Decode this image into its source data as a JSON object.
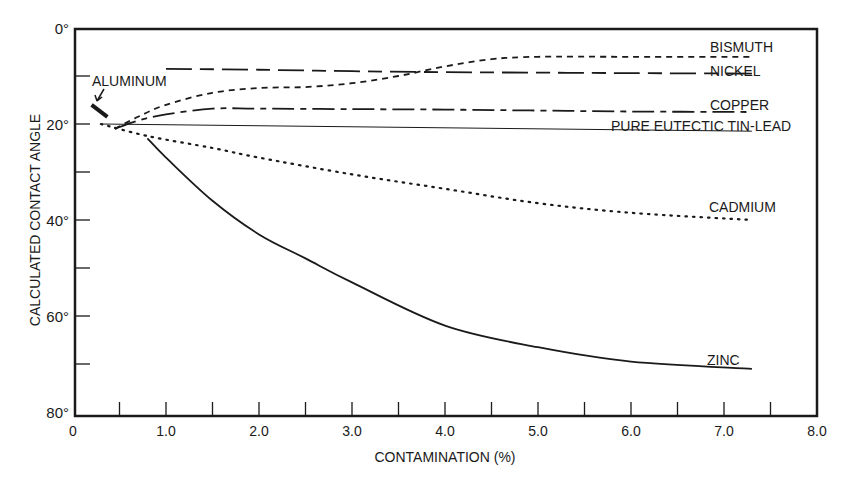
{
  "chart_data": {
    "type": "line",
    "title": "",
    "xlabel": "CONTAMINATION (%)",
    "ylabel": "CALCULATED CONTACT ANGLE",
    "xlim": [
      0,
      8.0
    ],
    "ylim": [
      0,
      80
    ],
    "y_inverted": true,
    "grid": false,
    "x_ticks": [
      "0",
      "1.0",
      "2.0",
      "3.0",
      "4.0",
      "5.0",
      "6.0",
      "7.0",
      "8.0"
    ],
    "x_tick_values": [
      0,
      1,
      2,
      3,
      4,
      5,
      6,
      7,
      8
    ],
    "x_minor_ticks": [
      0.5,
      1.5,
      2.5,
      3.5,
      4.5,
      5.5,
      6.5,
      7.5
    ],
    "y_ticks": [
      "0°",
      "20°",
      "40°",
      "60°",
      "80°"
    ],
    "y_tick_values": [
      0,
      20,
      40,
      60,
      80
    ],
    "y_minor_ticks": [
      10,
      30,
      50,
      70
    ],
    "series": [
      {
        "name": "BISMUTH",
        "style": "short-dash",
        "x": [
          0.45,
          0.7,
          1.0,
          1.5,
          2.0,
          2.5,
          3.0,
          3.5,
          4.0,
          4.5,
          5.0,
          6.0,
          7.3
        ],
        "y": [
          21,
          18.5,
          16,
          13.5,
          12.5,
          12.3,
          11.5,
          10,
          8,
          6.5,
          6,
          6,
          6
        ]
      },
      {
        "name": "NICKEL",
        "style": "long-dash",
        "x": [
          1.0,
          2.0,
          3.0,
          4.0,
          5.0,
          6.0,
          7.3
        ],
        "y": [
          8.5,
          8.7,
          9,
          9.2,
          9.3,
          9.4,
          9.5
        ]
      },
      {
        "name": "COPPER",
        "style": "dash-dot",
        "x": [
          0.45,
          0.7,
          1.0,
          1.5,
          2.0,
          3.0,
          4.0,
          5.0,
          6.0,
          7.3
        ],
        "y": [
          21,
          19.3,
          18,
          16.8,
          16.8,
          16.9,
          17,
          17.2,
          17.4,
          17.5
        ]
      },
      {
        "name": "PURE EUTECTIC TIN-LEAD",
        "style": "thin-solid",
        "x": [
          0.3,
          7.3
        ],
        "y": [
          20,
          21.5
        ]
      },
      {
        "name": "CADMIUM",
        "style": "dotted",
        "x": [
          0.3,
          0.8,
          1.5,
          2.0,
          3.0,
          4.0,
          5.0,
          6.0,
          7.3
        ],
        "y": [
          20,
          22.5,
          25,
          27,
          30.5,
          33.5,
          36.5,
          38.5,
          40
        ]
      },
      {
        "name": "ZINC",
        "style": "solid",
        "x": [
          0.8,
          1.0,
          1.5,
          2.0,
          2.5,
          3.0,
          4.0,
          5.0,
          6.0,
          7.3
        ],
        "y": [
          23,
          27,
          36,
          43,
          48,
          53,
          62,
          66.5,
          69.5,
          71
        ]
      },
      {
        "name": "ALUMINUM",
        "style": "thick-solid-segment",
        "x": [
          0.2,
          0.37
        ],
        "y": [
          16,
          18.5
        ]
      }
    ],
    "annotations": [
      {
        "text": "ALUMINUM",
        "arrow_to": [
          0.22,
          16.2
        ]
      }
    ],
    "legend_position": "inline-right-labels"
  },
  "labels": {
    "bismuth": "BISMUTH",
    "nickel": "NICKEL",
    "copper": "COPPER",
    "tinlead": "PURE EUTECTIC TIN-LEAD",
    "cadmium": "CADMIUM",
    "zinc": "ZINC",
    "aluminum": "ALUMINUM"
  },
  "colors": {
    "ink": "#1a1a1a",
    "background": "#ffffff"
  }
}
